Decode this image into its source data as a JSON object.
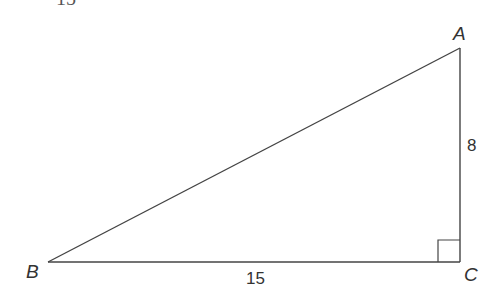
{
  "header": {
    "cut_off_text": "15"
  },
  "diagram": {
    "type": "right-triangle",
    "vertices": {
      "A": {
        "label": "A",
        "x": 460,
        "y": 48
      },
      "B": {
        "label": "B",
        "x": 48,
        "y": 262
      },
      "C": {
        "label": "C",
        "x": 460,
        "y": 262
      }
    },
    "sides": {
      "BC": {
        "label": "15"
      },
      "AC": {
        "label": "8"
      },
      "AB": {
        "label": ""
      }
    },
    "right_angle_at": "C",
    "stroke_color": "#444444",
    "label_color": "#333333"
  }
}
